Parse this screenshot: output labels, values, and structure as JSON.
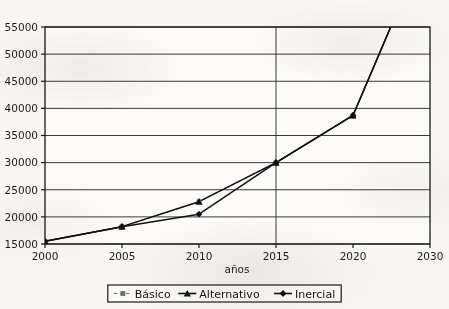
{
  "chart_data": {
    "type": "line",
    "title": "",
    "xlabel": "años",
    "ylabel": "",
    "x": [
      2000,
      2005,
      2010,
      2015,
      2020,
      2030
    ],
    "categories": [
      "2000",
      "2005",
      "2010",
      "2015",
      "2020",
      "2030"
    ],
    "xtick_labels": [
      "2000",
      "2005",
      "2010",
      "2015",
      "2020",
      "2030"
    ],
    "ytick_labels": [
      "15000",
      "20000",
      "25000",
      "30000",
      "35000",
      "40000",
      "45000",
      "50000",
      "55000"
    ],
    "ytick_values": [
      15000,
      20000,
      25000,
      30000,
      35000,
      40000,
      45000,
      50000,
      55000
    ],
    "ylim": [
      15000,
      55000
    ],
    "grid": "horizontal-gridlines-plus-vertical-at-2015",
    "legend_position": "bottom-center",
    "series": [
      {
        "name": "Básico",
        "marker": "square",
        "line_style": "dashed",
        "color": "#6e6e6e",
        "x": [
          2000,
          2005,
          2010,
          2015,
          2020,
          2030
        ],
        "values": [
          15500,
          18200,
          22800,
          30000,
          38700,
          null
        ],
        "note": "coincides with Alternativo over visible range"
      },
      {
        "name": "Alternativo",
        "marker": "triangle",
        "line_style": "solid",
        "color": "#111111",
        "x": [
          2000,
          2005,
          2010,
          2015,
          2020,
          2030
        ],
        "values": [
          15500,
          18200,
          22800,
          30000,
          38700,
          72000
        ],
        "note": "exits top of plot between 2020 and 2030"
      },
      {
        "name": "Inercial",
        "marker": "diamond",
        "line_style": "solid",
        "color": "#111111",
        "x": [
          2000,
          2005,
          2010,
          2015,
          2020,
          2030
        ],
        "values": [
          15500,
          18200,
          20500,
          30000,
          38700,
          72000
        ]
      }
    ],
    "legend": [
      {
        "label": "Básico",
        "marker": "square",
        "line_style": "dashed",
        "color": "#6e6e6e"
      },
      {
        "label": "Alternativo",
        "marker": "triangle",
        "line_style": "solid",
        "color": "#111111"
      },
      {
        "label": "Inercial",
        "marker": "diamond",
        "line_style": "solid",
        "color": "#111111"
      }
    ],
    "colors": {
      "frame": "#1a1a1a",
      "gridline": "#3a3a3a",
      "series_dark": "#111111",
      "series_gray": "#6e6e6e",
      "background": "#f8f7f5",
      "text": "#1c1c1c"
    }
  }
}
